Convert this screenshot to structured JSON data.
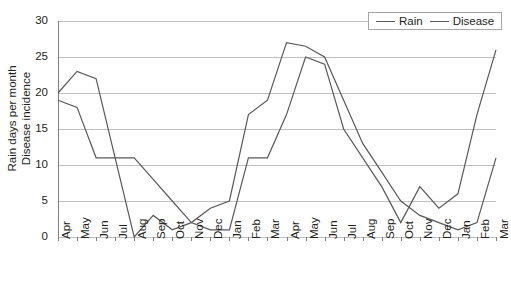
{
  "chart_data": {
    "type": "line",
    "title": "",
    "xlabel": "",
    "ylabel": "Rain days per month Disease incidence",
    "ylabel_lines": [
      "Rain days per month",
      "Disease incidence"
    ],
    "ylim": [
      0,
      30
    ],
    "yticks": [
      0,
      5,
      10,
      15,
      20,
      25,
      30
    ],
    "ytick_labels": [
      "0",
      "5",
      "10",
      "15",
      "20",
      "25",
      "30"
    ],
    "grid": true,
    "legend_position": "top-right",
    "categories": [
      "Apr",
      "May",
      "Jun",
      "Jul",
      "Aug",
      "Sep",
      "Oct",
      "Nov",
      "Dec",
      "Jan",
      "Feb",
      "Mar",
      "Apr",
      "May",
      "Jun",
      "Jul",
      "Aug",
      "Sep",
      "Oct",
      "Nov",
      "Dec",
      "Jan",
      "Feb",
      "Mar"
    ],
    "series": [
      {
        "name": "Rain",
        "color": "#595959",
        "values": [
          20,
          23,
          22,
          11,
          0,
          3,
          1,
          2,
          4,
          5,
          17,
          19,
          27,
          26.5,
          25,
          19,
          13,
          9,
          5,
          3,
          2,
          1,
          2,
          11
        ]
      },
      {
        "name": "Disease",
        "color": "#595959",
        "values": [
          19,
          18,
          11,
          11,
          11,
          8,
          5,
          2,
          1,
          1,
          11,
          11,
          17,
          25,
          24,
          15,
          11,
          7,
          2,
          7,
          4,
          6,
          17,
          26
        ]
      }
    ]
  },
  "legend": {
    "entries": [
      {
        "label": "Rain"
      },
      {
        "label": "Disease"
      }
    ]
  }
}
